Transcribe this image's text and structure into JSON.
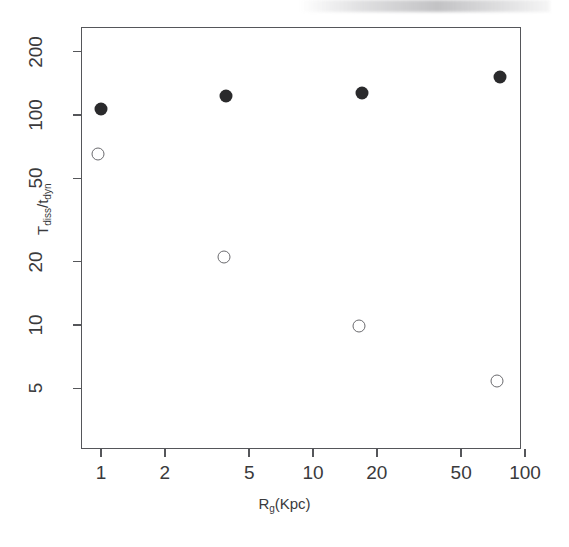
{
  "chart_data": {
    "type": "scatter",
    "title": "",
    "xlabel": "R_g(Kpc)",
    "ylabel": "T_diss/t_dyn",
    "xscale": "log",
    "yscale": "log",
    "xlim": [
      0.8,
      120
    ],
    "ylim": [
      3.6,
      300
    ],
    "grid": false,
    "legend": "none",
    "xticks": [
      1,
      2,
      5,
      10,
      20,
      50,
      100
    ],
    "xticklabels": [
      "1",
      "2",
      "5",
      "10",
      "20",
      "50",
      "100"
    ],
    "yticks": [
      5,
      10,
      20,
      50,
      100,
      200
    ],
    "yticklabels": [
      "5",
      "10",
      "20",
      "50",
      "100",
      "200"
    ],
    "series": [
      {
        "name": "filled-circles",
        "marker": "filled-circle",
        "color": "#2a2a2c",
        "x": [
          1.0,
          3.9,
          17.0,
          76.0
        ],
        "y": [
          107,
          123,
          127,
          152
        ]
      },
      {
        "name": "open-circles",
        "marker": "open-circle",
        "color": "#6a6a6e",
        "x": [
          0.97,
          3.8,
          16.5,
          74.0
        ],
        "y": [
          65,
          21,
          9.9,
          5.4
        ]
      }
    ]
  },
  "axis_title_parts": {
    "y_main": "T",
    "y_sub1": "diss",
    "y_mid": "/t",
    "y_sub2": "dyn",
    "x_main": "R",
    "x_sub": "g",
    "x_tail": "(Kpc)"
  }
}
